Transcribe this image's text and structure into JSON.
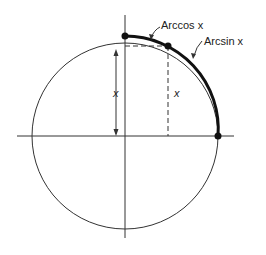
{
  "diagram": {
    "labels": {
      "arccos": "Arccos x",
      "arcsin": "Arcsin x",
      "x_left": "x",
      "x_right": "x"
    },
    "colors": {
      "stroke": "#222222",
      "background": "#ffffff"
    },
    "geometry": {
      "center": [
        125,
        136
      ],
      "radius": 93,
      "point_top": [
        125,
        36
      ],
      "point_mid": [
        168,
        46
      ],
      "point_right": [
        218,
        136
      ]
    }
  }
}
